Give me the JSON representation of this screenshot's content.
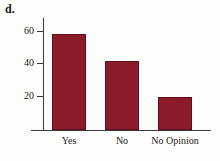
{
  "figure": {
    "panel_letter": "d.",
    "background_color": "#fdfdfb",
    "axis_color": "#3a3a3a"
  },
  "chart_data": {
    "type": "bar",
    "title": "",
    "subtitle": "",
    "xlabel": "",
    "ylabel": "",
    "categories": [
      "Yes",
      "No",
      "No Opinion"
    ],
    "values": [
      58,
      42,
      20
    ],
    "series": [
      {
        "name": "Responses",
        "values": [
          58,
          42,
          20
        ],
        "color": "#8b1a2b"
      }
    ],
    "ylim": [
      0,
      66
    ],
    "yticks": [
      20,
      40,
      60
    ],
    "ytick_labels": [
      "20",
      "40",
      "60"
    ],
    "xticks": [
      "Yes",
      "No",
      "No Opinion"
    ],
    "grid": false,
    "legend": false,
    "legend_position": "none",
    "bar_color": "#8b1a2b",
    "bar_edge_color": "#5d1019",
    "annotations": []
  }
}
